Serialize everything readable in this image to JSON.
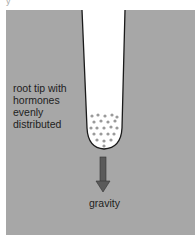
{
  "diagram": {
    "title_fragment": "y",
    "root_label_lines": [
      "root tip with",
      "hormones",
      "evenly",
      "distributed"
    ],
    "gravity_label": "gravity",
    "colors": {
      "background": "#a7a7a7",
      "root_fill": "#ffffff",
      "root_outline": "#1a1a1a",
      "hormone_dots": "#9a9a9a",
      "arrow": "#555555"
    },
    "icons": [
      "root-tip-shape",
      "hormone-dots",
      "gravity-arrow-icon"
    ]
  }
}
